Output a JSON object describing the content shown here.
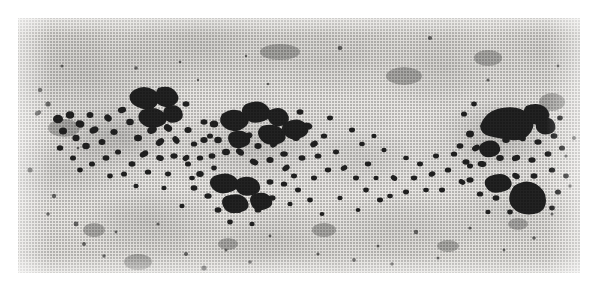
{
  "figure": {
    "kind": "photomicrograph",
    "caption": "",
    "label": "",
    "scale_bar": "",
    "annotations": []
  },
  "plate": {
    "border_color": "#ffffff",
    "paper_color": "#efedea",
    "background_tone": "#e6e4e0",
    "grain_color": "#232323",
    "halo_color": "#9a9a98",
    "left": 18,
    "top": 18,
    "width": 562,
    "height": 255
  },
  "image_content": {
    "clusters": [
      {
        "name": "left-cluster",
        "cx": 0.17,
        "cy": 0.46,
        "density": "high"
      },
      {
        "name": "center-cluster",
        "cx": 0.41,
        "cy": 0.5,
        "density": "very-high"
      },
      {
        "name": "bridge-scatter",
        "cx": 0.62,
        "cy": 0.56,
        "density": "low"
      },
      {
        "name": "right-cluster",
        "cx": 0.86,
        "cy": 0.45,
        "density": "high"
      }
    ],
    "background_description": "mottled light grey halftone field with diffuse darker patches and sparse isolated silver grains"
  }
}
